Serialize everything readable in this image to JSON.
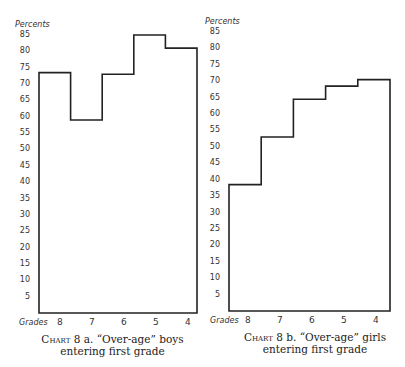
{
  "chart_data": [
    {
      "type": "bar",
      "style": "step",
      "title": "Chart 8 a. “Over-age” boys entering first grade",
      "xlabel": "Grades",
      "ylabel": "Percents",
      "categories": [
        "8",
        "7",
        "6",
        "5",
        "4"
      ],
      "values": [
        73.5,
        59,
        73,
        85,
        81
      ],
      "ylim": [
        0,
        85
      ],
      "yticks": [
        5,
        10,
        15,
        20,
        25,
        30,
        35,
        40,
        45,
        50,
        55,
        60,
        65,
        70,
        75,
        80,
        85
      ],
      "grid": false
    },
    {
      "type": "bar",
      "style": "step",
      "title": "Chart 8 b. “Over-age” girls entering first grade",
      "xlabel": "Grades",
      "ylabel": "Percents",
      "categories": [
        "8",
        "7",
        "6",
        "5",
        "4"
      ],
      "values": [
        38.5,
        53,
        64.5,
        68.5,
        70.5
      ],
      "ylim": [
        0,
        85
      ],
      "yticks": [
        5,
        10,
        15,
        20,
        25,
        30,
        35,
        40,
        45,
        50,
        55,
        60,
        65,
        70,
        75,
        80,
        85
      ],
      "grid": false
    }
  ],
  "left": {
    "ylabel": "Percents",
    "xlabel": "Grades",
    "caption_prefix": "Chart",
    "caption_line1_rest": " 8 a.  “Over-age”  boys",
    "caption_line2": "entering  first  grade"
  },
  "right": {
    "ylabel": "Percents",
    "xlabel": "Grades",
    "caption_prefix": "Chart",
    "caption_line1_rest": " 8 b.  “Over-age” girls",
    "caption_line2": "entering  first  grade"
  },
  "yticks": [
    "85",
    "80",
    "75",
    "70",
    "65",
    "60",
    "55",
    "50",
    "45",
    "40",
    "35",
    "30",
    "25",
    "20",
    "15",
    "10",
    "5"
  ],
  "xticks": [
    "8",
    "7",
    "6",
    "5",
    "4"
  ]
}
